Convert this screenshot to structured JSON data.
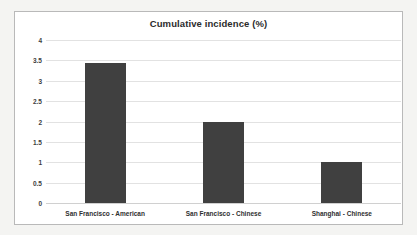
{
  "chart_data": {
    "type": "bar",
    "title": "Cumulative incidence (%)",
    "xlabel": "",
    "ylabel": "",
    "categories": [
      "San Francisco - American",
      "San Francisco - Chinese",
      "Shanghai - Chinese"
    ],
    "values": [
      3.43,
      2.0,
      1.0
    ],
    "ylim": [
      0,
      4
    ],
    "ytick_labels": [
      "0",
      "0.5",
      "1",
      "1.5",
      "2",
      "2.5",
      "3",
      "3.5",
      "4"
    ],
    "ytick_values": [
      0,
      0.5,
      1,
      1.5,
      2,
      2.5,
      3,
      3.5,
      4
    ],
    "grid": true,
    "legend": false,
    "legend_position": "none",
    "bar_color": "#404040",
    "gridline_color": "#e2e2e2",
    "plot_background": "#ffffff",
    "border_color": "#b9b9b9",
    "page_background": "#f4f4f2"
  }
}
